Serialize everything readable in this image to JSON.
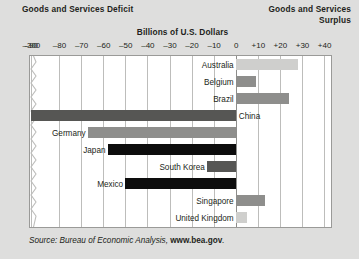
{
  "header": {
    "left_title": "Goods and Services Deficit",
    "right_title_line1": "Goods and Services",
    "right_title_line2": "Surplus"
  },
  "axis_title": "Billions of U.S. Dollars",
  "source": {
    "prefix": "Source:",
    "agency": " Bureau of Economic Analysis, ",
    "url": "www.bea.gov",
    "suffix": "."
  },
  "colors": {
    "page_background": "#dededd",
    "plot_background": "#ffffff",
    "plot_border": "#9a9a98",
    "gridline": "#bdbdbb",
    "zero_line": "#8d8d8b",
    "bar_light": "#cfcfcd",
    "bar_medium": "#8e8e8c",
    "bar_dark": "#565654",
    "bar_black": "#0d0d0d",
    "text": "#231f20"
  },
  "chart_data": {
    "type": "bar",
    "orientation": "horizontal",
    "title": "Billions of U.S. Dollars",
    "xlabel": "Billions of U.S. Dollars",
    "ylabel": "",
    "xlim": [
      -300,
      40
    ],
    "grid": true,
    "legend": "none",
    "axis_broken": true,
    "axis_break_between": [
      -300,
      -90
    ],
    "ticks": [
      {
        "value": -300,
        "label": "–300"
      },
      {
        "value": -90,
        "label": "–90"
      },
      {
        "value": -80,
        "label": "–80"
      },
      {
        "value": -70,
        "label": "–70"
      },
      {
        "value": -60,
        "label": "–60"
      },
      {
        "value": -50,
        "label": "–50"
      },
      {
        "value": -40,
        "label": "–40"
      },
      {
        "value": -30,
        "label": "–30"
      },
      {
        "value": -20,
        "label": "–20"
      },
      {
        "value": -10,
        "label": "–10"
      },
      {
        "value": 0,
        "label": "0"
      },
      {
        "value": 10,
        "label": "+10"
      },
      {
        "value": 20,
        "label": "+20"
      },
      {
        "value": 30,
        "label": "+30"
      },
      {
        "value": 40,
        "label": "+40"
      }
    ],
    "categories": [
      "Australia",
      "Belgium",
      "Brazil",
      "China",
      "Germany",
      "Japan",
      "South Korea",
      "Mexico",
      "Singapore",
      "United Kingdom"
    ],
    "values": [
      28,
      9,
      24,
      -300,
      -67,
      -58,
      -13,
      -50,
      13,
      5
    ],
    "bars": [
      {
        "label": "Australia",
        "value": 28,
        "shade": "light",
        "label_side": "left"
      },
      {
        "label": "Belgium",
        "value": 9,
        "shade": "medium",
        "label_side": "left"
      },
      {
        "label": "Brazil",
        "value": 24,
        "shade": "medium",
        "label_side": "left"
      },
      {
        "label": "China",
        "value": -300,
        "shade": "dark",
        "label_side": "right"
      },
      {
        "label": "Germany",
        "value": -67,
        "shade": "medium",
        "label_side": "left"
      },
      {
        "label": "Japan",
        "value": -58,
        "shade": "black",
        "label_side": "left"
      },
      {
        "label": "South Korea",
        "value": -13,
        "shade": "dark",
        "label_side": "left"
      },
      {
        "label": "Mexico",
        "value": -50,
        "shade": "black",
        "label_side": "left"
      },
      {
        "label": "Singapore",
        "value": 13,
        "shade": "medium",
        "label_side": "left"
      },
      {
        "label": "United Kingdom",
        "value": 5,
        "shade": "light",
        "label_side": "left"
      }
    ]
  }
}
